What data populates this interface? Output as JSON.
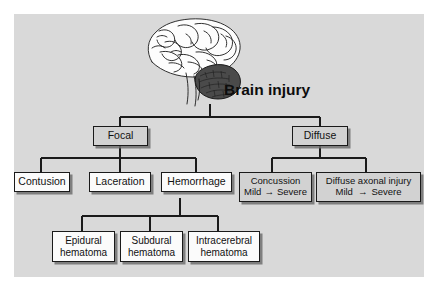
{
  "diagram": {
    "title": "Brain injury",
    "illustration": "brain-lateral-view-icon",
    "colors": {
      "panel_background": "#d9d9d9",
      "node_gray_fill": "#d2d2d2",
      "node_white_fill": "#fbfbfb",
      "line": "#1a1a1a",
      "text": "#111111"
    },
    "levels": {
      "root": "Brain injury",
      "branches": [
        "Focal",
        "Diffuse"
      ]
    },
    "nodes": {
      "focal": "Focal",
      "diffuse": "Diffuse",
      "contusion": "Contusion",
      "laceration": "Laceration",
      "hemorrhage": "Hemorrhage",
      "concussion": "Concussion",
      "diffuse_axonal_injury": "Diffuse axonal injury",
      "epidural_line1": "Epidural",
      "epidural_line2": "hematoma",
      "subdural_line1": "Subdural",
      "subdural_line2": "hematoma",
      "intracerebral_line1": "Intracerebral",
      "intracerebral_line2": "hematoma"
    },
    "severity": {
      "mild": "Mild",
      "severe": "Severe",
      "arrow": "→"
    }
  }
}
